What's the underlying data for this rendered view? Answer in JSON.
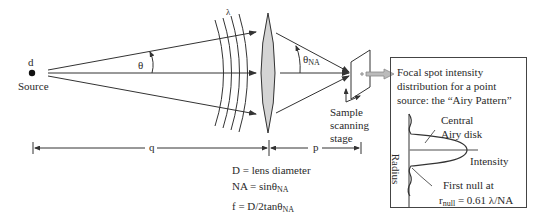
{
  "diagram": {
    "source": {
      "symbol": "d",
      "label": "Source"
    },
    "angles": {
      "source_angle": "θ",
      "na_angle_base": "θ",
      "na_angle_sub": "NA"
    },
    "wavelength": "λ",
    "distances": {
      "q": "q",
      "p": "p"
    },
    "stage_label": [
      "Sample",
      "scanning",
      "stage"
    ],
    "equations": [
      {
        "lhs": "D = lens diameter",
        "sub": ""
      },
      {
        "lhs": "NA = sinθ",
        "sub": "NA"
      },
      {
        "lhs": "f = D/2tanθ",
        "sub": "NA"
      }
    ],
    "inset": {
      "caption": [
        "Focal spot intensity",
        "distribution for a point",
        "source: the “Airy Pattern”"
      ],
      "central_label": [
        "Central",
        "Airy disk"
      ],
      "x_axis": "Intensity",
      "y_axis": "Radius",
      "first_null_label": "First null at",
      "first_null_eq_prefix": "r",
      "first_null_eq_sub": "null",
      "first_null_eq_suffix": " = 0.61 λ/NA"
    },
    "colors": {
      "line": "#333333",
      "lens_fill": "#d4d4d4",
      "arrow_fill": "#bbbbbb",
      "box_border": "#444444"
    }
  }
}
